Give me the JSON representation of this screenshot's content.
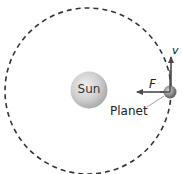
{
  "diagram": {
    "title": "",
    "labels": {
      "sun": "Sun",
      "planet": "Planet",
      "force": "F",
      "velocity": "v"
    },
    "elements": {
      "orbit": {
        "style": "dashed circle",
        "color": "#333333"
      },
      "sun": {
        "shape": "sphere",
        "color": "#c8c8c8"
      },
      "planet": {
        "shape": "sphere",
        "color": "#8a8a8a"
      },
      "force_arrow": {
        "direction": "toward Sun (left)",
        "color": "#4a4a4a"
      },
      "velocity_arrow": {
        "direction": "up (tangent to orbit)",
        "color": "#4a4a4a"
      }
    }
  }
}
